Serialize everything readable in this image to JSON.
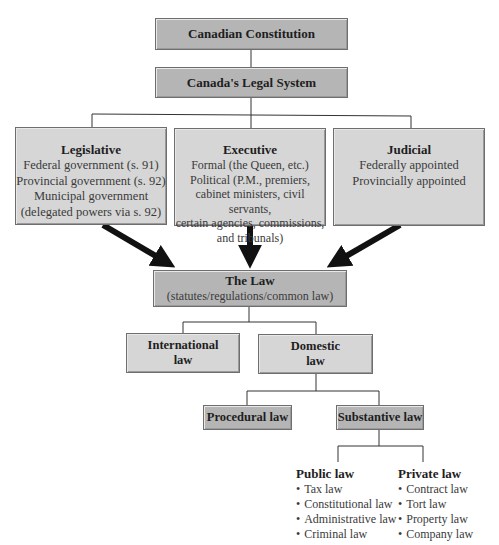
{
  "nodes": {
    "constitution": {
      "title": "Canadian Constitution"
    },
    "legal_system": {
      "title": "Canada's Legal System"
    },
    "legislative": {
      "title": "Legislative",
      "lines": [
        "Federal government (s. 91)",
        "Provincial government (s. 92)",
        "Municipal government",
        "(delegated powers via s. 92)"
      ]
    },
    "executive": {
      "title": "Executive",
      "lines": [
        "Formal (the Queen, etc.)",
        "Political (P.M., premiers,",
        "cabinet ministers, civil servants,",
        "certain agencies, commissions,",
        "and tribunals)"
      ]
    },
    "judicial": {
      "title": "Judicial",
      "lines": [
        "Federally appointed",
        "Provincially appointed"
      ]
    },
    "the_law": {
      "title": "The Law",
      "subtitle": "(statutes/regulations/common law)"
    },
    "international": {
      "line1": "International",
      "line2": "law"
    },
    "domestic": {
      "line1": "Domestic",
      "line2": "law"
    },
    "procedural": {
      "title": "Procedural law"
    },
    "substantive": {
      "title": "Substantive law"
    },
    "public_law": {
      "title": "Public law",
      "items": [
        "Tax law",
        "Constitutional law",
        "Administrative law",
        "Criminal law"
      ]
    },
    "private_law": {
      "title": "Private law",
      "items": [
        "Contract law",
        "Tort law",
        "Property law",
        "Company law"
      ]
    }
  },
  "colors": {
    "dark_box": "#b5b5b5",
    "light_box": "#d6d6d6",
    "arrow": "#111111",
    "connector": "#333333"
  }
}
